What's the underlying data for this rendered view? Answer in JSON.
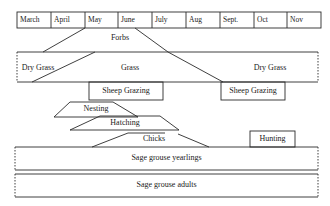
{
  "timeline": {
    "months": [
      "March",
      "April",
      "May",
      "June",
      "July",
      "Aug",
      "Sept.",
      "Oct",
      "Nov"
    ]
  },
  "vegetation": {
    "forbs": "Forbs",
    "dry_grass_early": "Dry Grass",
    "grass": "Grass",
    "dry_grass_late": "Dry Grass"
  },
  "land_use": {
    "sheep_grazing_spring": "Sheep Grazing",
    "sheep_grazing_fall": "Sheep Grazing",
    "hunting": "Hunting"
  },
  "sage_grouse": {
    "nesting": "Nesting",
    "hatching": "Hatching",
    "chicks": "Chicks",
    "yearlings": "Sage grouse yearlings",
    "adults": "Sage grouse adults"
  },
  "colors": {
    "line": "#2a2a2a",
    "background": "#ffffff"
  }
}
